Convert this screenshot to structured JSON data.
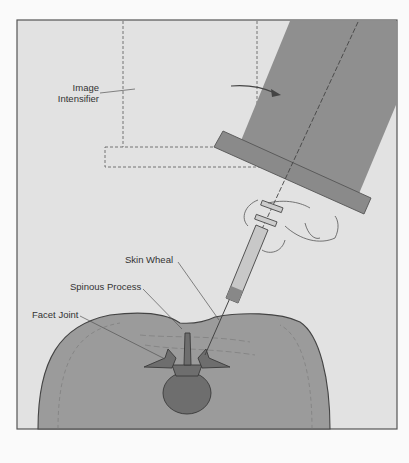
{
  "figure": {
    "labels": {
      "image_intensifier_line1": "Image",
      "image_intensifier_line2": "Intensifier",
      "skin_wheal": "Skin Wheal",
      "spinous_process": "Spinous Process",
      "facet_joint": "Facet Joint"
    },
    "colors": {
      "background": "#e4e4e4",
      "frame": "#555555",
      "intensifier": "#8e8e8e",
      "body": "#9a9a9a",
      "bone": "#6e6e6e",
      "outline": "#444444"
    }
  }
}
